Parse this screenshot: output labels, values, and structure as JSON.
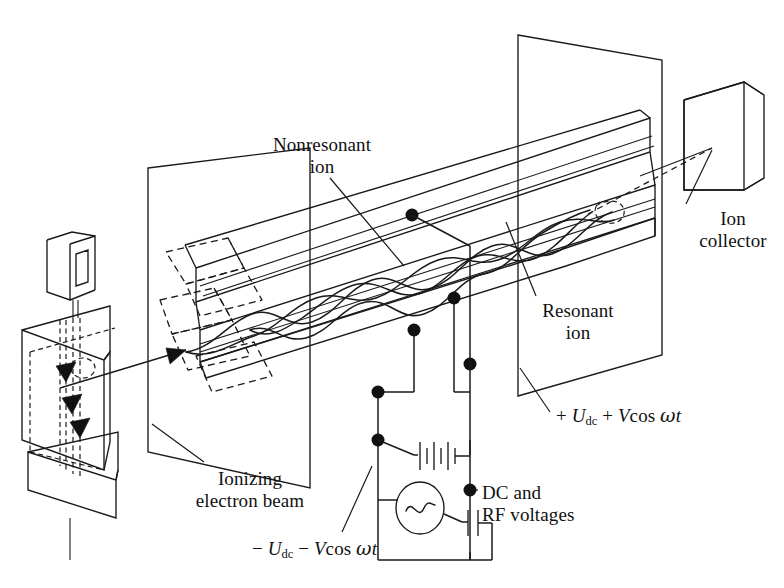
{
  "figure": {
    "background_color": "#ffffff",
    "line_color": "#1a1a1a"
  },
  "labels": {
    "nonresonant_ion": {
      "line1": "Nonresonant",
      "line2": "ion"
    },
    "ion_collector": {
      "line1": "Ion",
      "line2": "collector"
    },
    "resonant_ion": {
      "line1": "Resonant",
      "line2": "ion"
    },
    "dc_rf_voltages": {
      "line1": "DC and",
      "line2": "RF voltages"
    },
    "ionizing_electron_beam": {
      "line1": "Ionizing",
      "line2": "electron beam"
    },
    "positive_voltage": {
      "sign": "+",
      "dc_symbol": "U",
      "dc_subscript": "dc",
      "plus": "+",
      "rf_symbol": "V",
      "rf_function": "cos",
      "omega": "ω",
      "time": "t",
      "full_text": "+ Udc + Vcos ωt"
    },
    "negative_voltage": {
      "sign": "−",
      "dc_symbol": "U",
      "dc_subscript": "dc",
      "minus": "−",
      "rf_symbol": "V",
      "rf_function": "cos",
      "omega": "ω",
      "time": "t",
      "full_text": "− Udc − Vcos ωt"
    }
  },
  "components": {
    "ion_source": "ion-source-block",
    "filament": "filament-u-shape",
    "quadrupole_rods": "quadrupole-rod-assembly",
    "entrance_plane": "entrance-aperture-plane",
    "exit_plane": "exit-aperture-plane",
    "collector_slab": "ion-collector-slab",
    "battery": "dc-battery-symbol",
    "ac_source": "ac-generator-symbol",
    "capacitor": "capacitor-symbol",
    "electron_beam_arrows": 3,
    "rod_connection_nodes": 4,
    "circuit_junction_nodes": 3
  }
}
